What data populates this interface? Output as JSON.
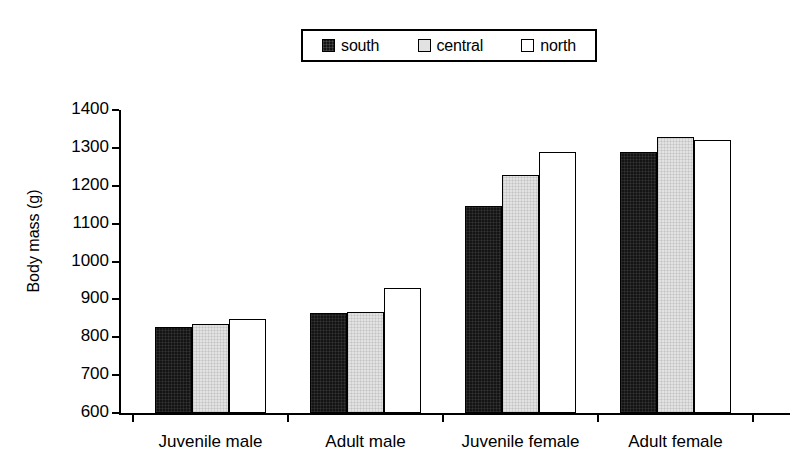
{
  "chart_data": {
    "type": "bar",
    "title": "",
    "xlabel": "",
    "ylabel": "Body mass (g)",
    "ylim": [
      600,
      1400
    ],
    "ytick_step": 100,
    "yticks": [
      600,
      700,
      800,
      900,
      1000,
      1100,
      1200,
      1300,
      1400
    ],
    "grid": false,
    "legend_position": "top-center",
    "categories": [
      "Juvenile male",
      "Adult male",
      "Juvenile female",
      "Adult female"
    ],
    "series": [
      {
        "name": "south",
        "color": "#141414",
        "swatch": "dark-filled-square",
        "values": [
          826,
          863,
          1147,
          1289
        ]
      },
      {
        "name": "central",
        "color": "#e2e2e2",
        "swatch": "light-gray-square",
        "values": [
          836,
          867,
          1228,
          1330
        ]
      },
      {
        "name": "north",
        "color": "#ffffff",
        "swatch": "white-square",
        "values": [
          849,
          930,
          1288,
          1322
        ]
      }
    ]
  },
  "legend": {
    "entries": [
      {
        "label": "south"
      },
      {
        "label": "central"
      },
      {
        "label": "north"
      }
    ]
  },
  "axes": {
    "y_label": "Body mass (g)"
  }
}
